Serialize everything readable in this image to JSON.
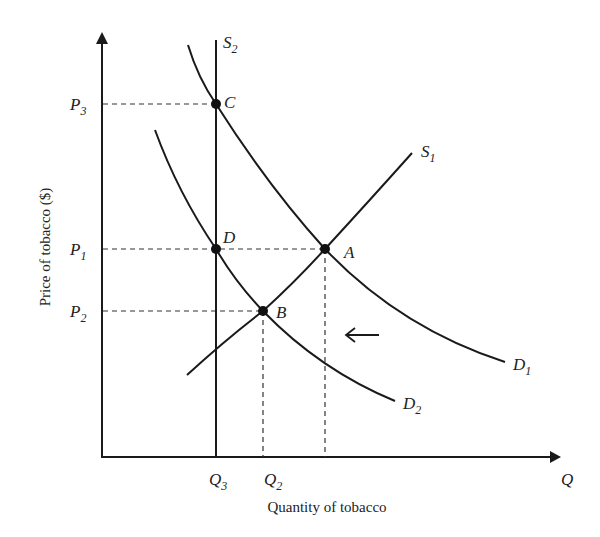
{
  "diagram": {
    "type": "supply-demand",
    "y_axis_label": "Price of tobacco ($)",
    "x_axis_label": "Quantity of tobacco",
    "x_axis_end_label": "Q",
    "price_labels": {
      "p3": "P",
      "p3_sub": "3",
      "p1": "P",
      "p1_sub": "1",
      "p2": "P",
      "p2_sub": "2"
    },
    "quantity_labels": {
      "q3": "Q",
      "q3_sub": "3",
      "q2": "Q",
      "q2_sub": "2"
    },
    "curves": {
      "s2": {
        "name": "S",
        "sub": "2"
      },
      "s1": {
        "name": "S",
        "sub": "1"
      },
      "d1": {
        "name": "D",
        "sub": "1"
      },
      "d2": {
        "name": "D",
        "sub": "2"
      }
    },
    "points": {
      "a": "A",
      "b": "B",
      "c": "C",
      "d": "D"
    },
    "shift_arrow": "leftward demand shift",
    "line_color": "#1a1a1a"
  }
}
